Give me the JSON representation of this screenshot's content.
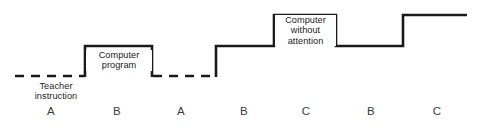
{
  "figure": {
    "title": "",
    "annotations": {
      "teacher_instruction": "Teacher\ninstruction",
      "computer_program": "Computer\nprogram",
      "computer_without_attention": "Computer\nwithout\nattention"
    },
    "axis_letters": [
      "A",
      "B",
      "A",
      "B",
      "C",
      "B",
      "C"
    ],
    "stroke_color": "#1a1a1a",
    "text_color": "#1a1a1a",
    "letter_color": "#3a3a3a",
    "background_color": "#ffffff"
  },
  "chart_data": {
    "type": "line",
    "title": "",
    "xlabel": "",
    "ylabel": "",
    "grid": false,
    "legend": "none",
    "levels": {
      "baseline": 0,
      "low": 1,
      "mid": 2,
      "high": 3
    },
    "categories": [
      "A",
      "B",
      "A",
      "B",
      "C",
      "B",
      "C"
    ],
    "values": [
      0,
      1,
      0,
      2,
      3,
      2,
      3
    ],
    "segments": [
      {
        "phase": "A",
        "level": 0,
        "style": "dashed",
        "x_start": 15,
        "x_end": 85,
        "y": 76,
        "label": "Teacher instruction"
      },
      {
        "phase": "B",
        "level": 1,
        "style": "solid",
        "x_start": 85,
        "x_end": 152,
        "y": 46,
        "label": "Computer program"
      },
      {
        "phase": "A",
        "level": 0,
        "style": "dashed",
        "x_start": 152,
        "x_end": 216,
        "y": 76,
        "label": ""
      },
      {
        "phase": "B",
        "level": 2,
        "style": "solid",
        "x_start": 216,
        "x_end": 274,
        "y": 46,
        "label": ""
      },
      {
        "phase": "C",
        "level": 3,
        "style": "solid",
        "x_start": 274,
        "x_end": 336,
        "y": 15,
        "label": "Computer without attention"
      },
      {
        "phase": "B",
        "level": 2,
        "style": "solid",
        "x_start": 336,
        "x_end": 403,
        "y": 46,
        "label": ""
      },
      {
        "phase": "C",
        "level": 3,
        "style": "solid",
        "x_start": 403,
        "x_end": 467,
        "y": 15,
        "label": ""
      }
    ],
    "axis_tick_positions": [
      51,
      117,
      181,
      244,
      306,
      371,
      437
    ]
  }
}
